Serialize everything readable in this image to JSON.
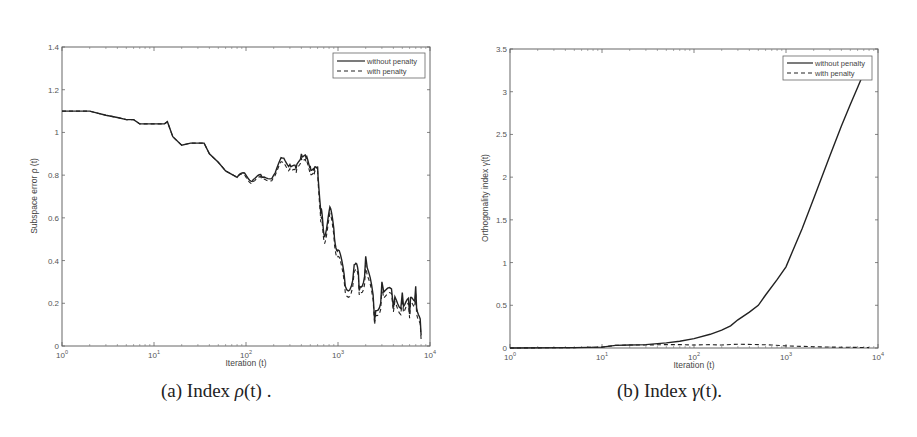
{
  "chart_data": [
    {
      "type": "line",
      "caption": "(a) Index ρ(t) .",
      "caption_parts": {
        "prefix": "(a) Index ",
        "symbol": "ρ",
        "arg": "(t)",
        "suffix": " ."
      },
      "xlabel": "Iteration (t)",
      "ylabel": "Subspace error  ρ (t)",
      "xscale": "log",
      "xlim": [
        1,
        10000
      ],
      "ylim": [
        0,
        1.4
      ],
      "xticks": [
        "10^0",
        "10^1",
        "10^2",
        "10^3",
        "10^4"
      ],
      "yticks": [
        "0",
        "0.2",
        "0.4",
        "0.6",
        "0.8",
        "1",
        "1.2",
        "1.4"
      ],
      "grid": false,
      "legend_position": "upper right",
      "legend": [
        "without penalty",
        "with penalty"
      ],
      "series": [
        {
          "name": "without penalty",
          "style": "solid",
          "x": [
            1,
            2,
            3,
            4,
            5,
            6,
            7,
            10,
            13,
            14,
            16,
            20,
            25,
            35,
            40,
            50,
            60,
            80,
            100,
            120,
            150,
            200,
            250,
            300,
            350,
            400,
            450,
            500,
            550,
            600,
            650,
            700,
            800,
            900,
            1000,
            1200,
            1500,
            1700,
            2000,
            2500,
            3000,
            4000,
            5000,
            6000,
            7000,
            8000
          ],
          "y": [
            1.1,
            1.1,
            1.08,
            1.07,
            1.06,
            1.06,
            1.04,
            1.04,
            1.04,
            1.05,
            0.98,
            0.94,
            0.95,
            0.95,
            0.9,
            0.86,
            0.82,
            0.79,
            0.8,
            0.78,
            0.79,
            0.8,
            0.88,
            0.85,
            0.83,
            0.9,
            0.88,
            0.84,
            0.82,
            0.84,
            0.62,
            0.53,
            0.63,
            0.55,
            0.45,
            0.28,
            0.38,
            0.26,
            0.42,
            0.12,
            0.3,
            0.18,
            0.25,
            0.15,
            0.28,
            0.05
          ]
        },
        {
          "name": "with penalty",
          "style": "dashed",
          "x": [
            1,
            2,
            3,
            4,
            5,
            6,
            7,
            10,
            13,
            14,
            16,
            20,
            25,
            35,
            40,
            50,
            60,
            80,
            100,
            120,
            150,
            200,
            250,
            300,
            350,
            400,
            450,
            500,
            550,
            600,
            650,
            700,
            800,
            900,
            1000,
            1200,
            1500,
            1700,
            2000,
            2500,
            3000,
            4000,
            5000,
            6000,
            7000,
            8000
          ],
          "y": [
            1.1,
            1.1,
            1.08,
            1.07,
            1.06,
            1.06,
            1.04,
            1.04,
            1.04,
            1.05,
            0.98,
            0.94,
            0.95,
            0.95,
            0.9,
            0.86,
            0.82,
            0.79,
            0.79,
            0.77,
            0.78,
            0.79,
            0.86,
            0.83,
            0.81,
            0.88,
            0.86,
            0.82,
            0.8,
            0.82,
            0.58,
            0.5,
            0.6,
            0.52,
            0.42,
            0.25,
            0.35,
            0.24,
            0.38,
            0.1,
            0.27,
            0.16,
            0.22,
            0.13,
            0.25,
            0.03
          ]
        }
      ]
    },
    {
      "type": "line",
      "caption": "(b) Index γ(t).",
      "caption_parts": {
        "prefix": "(b) Index ",
        "symbol": "γ",
        "arg": "(t)",
        "suffix": "."
      },
      "xlabel": "Iteration (t)",
      "ylabel": "Orthogonality index  γ(t)",
      "xscale": "log",
      "xlim": [
        1,
        10000
      ],
      "ylim": [
        0,
        3.5
      ],
      "xticks": [
        "10^0",
        "10^1",
        "10^2",
        "10^3",
        "10^4"
      ],
      "yticks": [
        "0",
        "0.5",
        "1",
        "1.5",
        "2",
        "2.5",
        "3",
        "3.5"
      ],
      "grid": false,
      "legend_position": "upper right",
      "legend": [
        "without penalty",
        "with penalty"
      ],
      "series": [
        {
          "name": "without penalty",
          "style": "solid",
          "x": [
            1,
            5,
            10,
            14,
            20,
            30,
            50,
            70,
            100,
            150,
            200,
            250,
            300,
            400,
            500,
            600,
            800,
            1000,
            1500,
            2000,
            3000,
            4000,
            5000,
            6000,
            7000,
            8000
          ],
          "y": [
            0.0,
            0.005,
            0.01,
            0.03,
            0.035,
            0.04,
            0.06,
            0.08,
            0.11,
            0.16,
            0.21,
            0.26,
            0.33,
            0.42,
            0.5,
            0.62,
            0.8,
            0.95,
            1.4,
            1.75,
            2.25,
            2.6,
            2.85,
            3.05,
            3.22,
            3.4
          ]
        },
        {
          "name": "with penalty",
          "style": "dashed",
          "x": [
            1,
            5,
            10,
            14,
            20,
            30,
            50,
            70,
            100,
            150,
            200,
            300,
            500,
            700,
            1000,
            2000,
            3000,
            5000,
            8000
          ],
          "y": [
            0.0,
            0.005,
            0.01,
            0.03,
            0.035,
            0.035,
            0.04,
            0.04,
            0.035,
            0.04,
            0.035,
            0.045,
            0.04,
            0.035,
            0.025,
            0.015,
            0.01,
            0.008,
            0.005
          ]
        }
      ]
    }
  ],
  "panels": {
    "left": {
      "xlabel": "Iteration (t)",
      "ylabel": "Subspace error  ρ (t)",
      "legend_solid": "without penalty",
      "legend_dashed": "with penalty",
      "caption_prefix": "(a) Index ",
      "caption_symbol": "ρ",
      "caption_arg": "(t)",
      "caption_suffix": " ."
    },
    "right": {
      "xlabel": "Iteration (t)",
      "ylabel": "Orthogonality index  γ(t)",
      "legend_solid": "without penalty",
      "legend_dashed": "with penalty",
      "caption_prefix": "(b) Index ",
      "caption_symbol": "γ",
      "caption_arg": "(t)",
      "caption_suffix": "."
    }
  },
  "colors": {
    "line": "#222222",
    "axis": "#555555",
    "text": "#444444"
  }
}
